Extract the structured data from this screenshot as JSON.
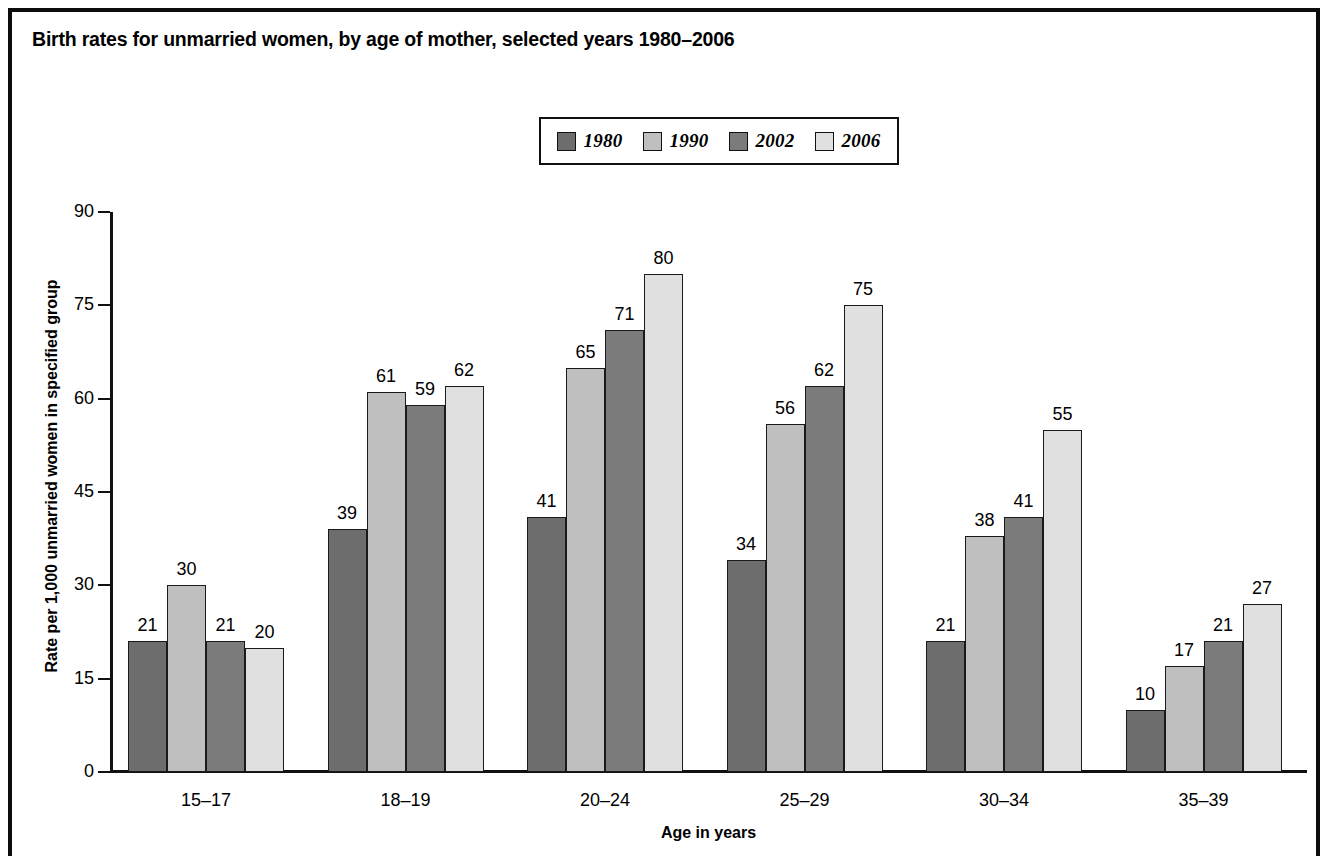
{
  "chart_data": {
    "type": "bar",
    "title": "Birth rates for unmarried women, by age of mother, selected years 1980–2006",
    "xlabel": "Age in years",
    "ylabel": "Rate per 1,000 unmarried women in specified group",
    "categories": [
      "15–17",
      "18–19",
      "20–24",
      "25–29",
      "30–34",
      "35–39"
    ],
    "series": [
      {
        "name": "1980",
        "color": "#6d6d6d",
        "values": [
          21,
          39,
          41,
          34,
          21,
          10
        ]
      },
      {
        "name": "1990",
        "color": "#bfbfbf",
        "values": [
          30,
          61,
          65,
          56,
          38,
          17
        ]
      },
      {
        "name": "2002",
        "color": "#7b7b7b",
        "values": [
          21,
          59,
          71,
          62,
          41,
          21
        ]
      },
      {
        "name": "2006",
        "color": "#e0e0e0",
        "values": [
          20,
          62,
          80,
          75,
          55,
          27
        ]
      }
    ],
    "ylim": [
      0,
      90
    ],
    "yticks": [
      0,
      15,
      30,
      45,
      60,
      75,
      90
    ],
    "ytick_labels": [
      "0",
      "15",
      "30",
      "45",
      "60",
      "75",
      "90"
    ],
    "grid": false,
    "legend_position": "top-center",
    "bar_labels": true
  },
  "legend": {
    "entries": [
      {
        "label": "1980"
      },
      {
        "label": "1990"
      },
      {
        "label": "2002"
      },
      {
        "label": "2006"
      }
    ]
  }
}
